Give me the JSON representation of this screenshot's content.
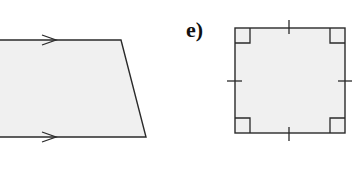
{
  "figure_label": "e)",
  "colors": {
    "stroke": "#2a2a2a",
    "fill": "#f0f0f0",
    "background": "#ffffff"
  },
  "shapes": [
    {
      "name": "trapezium",
      "description": "Quadrilateral with one pair of parallel sides (arrow marks on top and bottom edges), partially cropped at left",
      "marks": [
        "parallel-arrow-top",
        "parallel-arrow-bottom"
      ]
    },
    {
      "name": "square",
      "label": "e)",
      "description": "Square with four right-angle marks and equal-side tick marks on each side",
      "marks": [
        "right-angle x4",
        "equal-side-tick x4"
      ]
    }
  ]
}
